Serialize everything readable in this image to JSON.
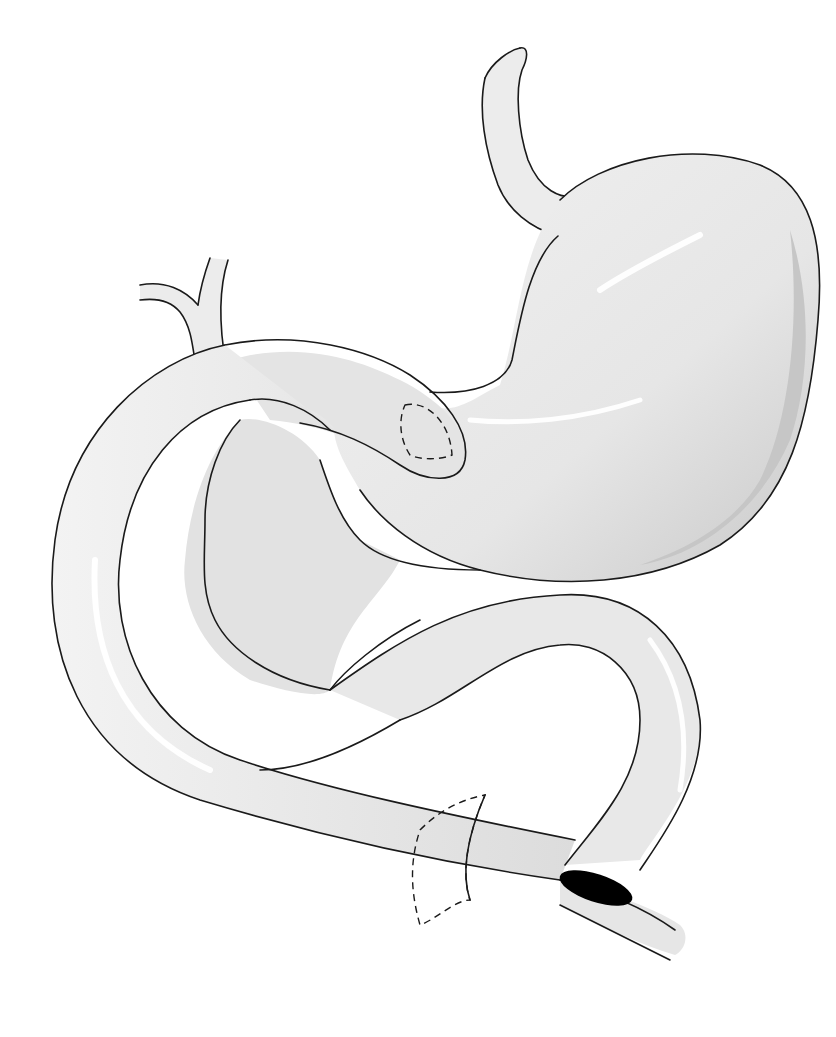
{
  "figure": {
    "type": "anatomical-illustration",
    "colors": {
      "background": "#ffffff",
      "organ_fill": "#ebebeb",
      "shadow": "#c4c4c4",
      "highlight": "#ffffff",
      "outline": "#1a1a1a",
      "lumen": "#000000"
    },
    "elements": [
      {
        "name": "esophagus",
        "label": ""
      },
      {
        "name": "stomach",
        "label": ""
      },
      {
        "name": "gastric-stapled-closure",
        "style": "dashed"
      },
      {
        "name": "proximal-loop-with-duct-anastomosis",
        "lumen": "filled-black"
      },
      {
        "name": "s-shaped-bowel-loop"
      },
      {
        "name": "distal-limb-transection-line",
        "style": "dashed"
      },
      {
        "name": "jejunojejunal-anastomosis",
        "lumen": "filled-black"
      }
    ],
    "text_labels": []
  }
}
